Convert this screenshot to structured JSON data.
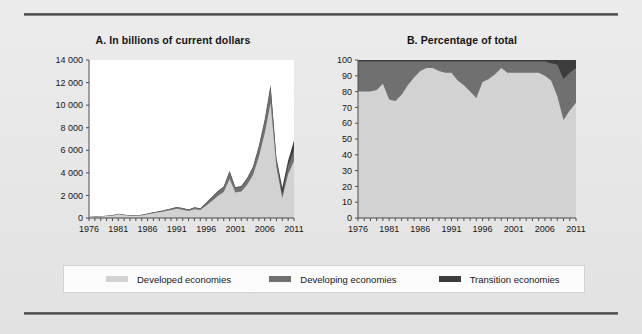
{
  "figure": {
    "panels": [
      {
        "id": "a",
        "title": "A. In billions of current dollars",
        "y_ticks": [
          "14 000",
          "12 000",
          "10 000",
          "8 000",
          "6 000",
          "4 000",
          "2 000",
          "0"
        ],
        "x_ticks": [
          "1976",
          "1981",
          "1986",
          "1991",
          "1996",
          "2001",
          "2006",
          "2011"
        ]
      },
      {
        "id": "b",
        "title": "B. Percentage of total",
        "y_ticks": [
          "100",
          "90",
          "80",
          "70",
          "60",
          "50",
          "40",
          "30",
          "20",
          "10",
          "0"
        ],
        "x_ticks": [
          "1976",
          "1981",
          "1986",
          "1991",
          "1996",
          "2001",
          "2006",
          "2011"
        ]
      }
    ]
  },
  "legend": {
    "items": [
      {
        "label": "Developed economies",
        "color": "#d2d2d2"
      },
      {
        "label": "Developing economies",
        "color": "#707070"
      },
      {
        "label": "Transition economies",
        "color": "#3c3c3c"
      }
    ]
  },
  "colors": {
    "developed": "#d2d2d2",
    "developing": "#707070",
    "transition": "#3c3c3c",
    "panel_a_background": "#ffffff",
    "panel_b_background": "#d2d2d2",
    "axis": "#4d4d4d",
    "page_background": "#e9e9e9",
    "rule": "#4a4a4a"
  },
  "chart_data": [
    {
      "type": "area",
      "title": "A. In billions of current dollars",
      "xlabel": "",
      "ylabel": "",
      "stacked": true,
      "grid": false,
      "legend_position": "bottom",
      "xlim": [
        1976,
        2011
      ],
      "ylim": [
        0,
        14000
      ],
      "x": [
        1976,
        1977,
        1978,
        1979,
        1980,
        1981,
        1982,
        1983,
        1984,
        1985,
        1986,
        1987,
        1988,
        1989,
        1990,
        1991,
        1992,
        1993,
        1994,
        1995,
        1996,
        1997,
        1998,
        1999,
        2000,
        2001,
        2002,
        2003,
        2004,
        2005,
        2006,
        2007,
        2008,
        2009,
        2010,
        2011
      ],
      "categories": [
        "1976",
        "1977",
        "1978",
        "1979",
        "1980",
        "1981",
        "1982",
        "1983",
        "1984",
        "1985",
        "1986",
        "1987",
        "1988",
        "1989",
        "1990",
        "1991",
        "1992",
        "1993",
        "1994",
        "1995",
        "1996",
        "1997",
        "1998",
        "1999",
        "2000",
        "2001",
        "2002",
        "2003",
        "2004",
        "2005",
        "2006",
        "2007",
        "2008",
        "2009",
        "2010",
        "2011"
      ],
      "series": [
        {
          "name": "Developed economies",
          "color": "#d2d2d2",
          "values": [
            85,
            110,
            140,
            175,
            210,
            330,
            245,
            195,
            205,
            230,
            330,
            430,
            500,
            600,
            700,
            820,
            730,
            620,
            780,
            700,
            1100,
            1500,
            1950,
            2300,
            3450,
            2250,
            2350,
            2950,
            3800,
            5400,
            7500,
            10200,
            4500,
            1750,
            3900,
            5050
          ]
        },
        {
          "name": "Developing economies",
          "color": "#707070",
          "values": [
            10,
            15,
            20,
            25,
            30,
            45,
            40,
            35,
            40,
            45,
            55,
            70,
            85,
            100,
            120,
            140,
            130,
            120,
            160,
            150,
            230,
            330,
            380,
            430,
            620,
            420,
            430,
            520,
            650,
            850,
            1050,
            1350,
            700,
            320,
            720,
            1000
          ]
        },
        {
          "name": "Transition economies",
          "color": "#3c3c3c",
          "values": [
            2,
            2,
            3,
            3,
            4,
            5,
            5,
            4,
            5,
            5,
            6,
            8,
            10,
            12,
            15,
            18,
            16,
            15,
            20,
            18,
            30,
            45,
            55,
            60,
            90,
            60,
            65,
            80,
            100,
            130,
            160,
            230,
            130,
            620,
            480,
            820
          ]
        }
      ],
      "annotations": [
        {
          "text": "peak",
          "x": 2007,
          "y": 11780
        }
      ]
    },
    {
      "type": "area",
      "title": "B. Percentage of total",
      "xlabel": "",
      "ylabel": "",
      "stacked": true,
      "normalized": true,
      "grid": false,
      "legend_position": "bottom",
      "xlim": [
        1976,
        2011
      ],
      "ylim": [
        0,
        100
      ],
      "x": [
        1976,
        1977,
        1978,
        1979,
        1980,
        1981,
        1982,
        1983,
        1984,
        1985,
        1986,
        1987,
        1988,
        1989,
        1990,
        1991,
        1992,
        1993,
        1994,
        1995,
        1996,
        1997,
        1998,
        1999,
        2000,
        2001,
        2002,
        2003,
        2004,
        2005,
        2006,
        2007,
        2008,
        2009,
        2010,
        2011
      ],
      "categories": [
        "1976",
        "1977",
        "1978",
        "1979",
        "1980",
        "1981",
        "1982",
        "1983",
        "1984",
        "1985",
        "1986",
        "1987",
        "1988",
        "1989",
        "1990",
        "1991",
        "1992",
        "1993",
        "1994",
        "1995",
        "1996",
        "1997",
        "1998",
        "1999",
        "2000",
        "2001",
        "2002",
        "2003",
        "2004",
        "2005",
        "2006",
        "2007",
        "2008",
        "2009",
        "2010",
        "2011"
      ],
      "series": [
        {
          "name": "Developed economies",
          "color": "#d2d2d2",
          "values": [
            80,
            80,
            80,
            81,
            85,
            75,
            74,
            78,
            84,
            89,
            93,
            95,
            95,
            93,
            92,
            92,
            87,
            84,
            80,
            76,
            86,
            88,
            91,
            95,
            92,
            92,
            92,
            92,
            92,
            92,
            90,
            87,
            77,
            62,
            68,
            73
          ]
        },
        {
          "name": "Developing economies",
          "color": "#707070",
          "values": [
            19,
            19,
            19,
            18,
            14,
            24,
            25,
            21,
            15,
            10,
            6,
            4,
            4,
            6,
            7,
            7,
            12,
            15,
            19,
            23,
            13,
            11,
            8,
            4,
            7,
            7,
            7,
            7,
            7,
            7,
            9,
            11,
            20,
            26,
            24,
            22
          ]
        },
        {
          "name": "Transition economies",
          "color": "#3c3c3c",
          "values": [
            1,
            1,
            1,
            1,
            1,
            1,
            1,
            1,
            1,
            1,
            1,
            1,
            1,
            1,
            1,
            1,
            1,
            1,
            1,
            1,
            1,
            1,
            1,
            1,
            1,
            1,
            1,
            1,
            1,
            1,
            1,
            2,
            3,
            12,
            8,
            5
          ]
        }
      ]
    }
  ]
}
